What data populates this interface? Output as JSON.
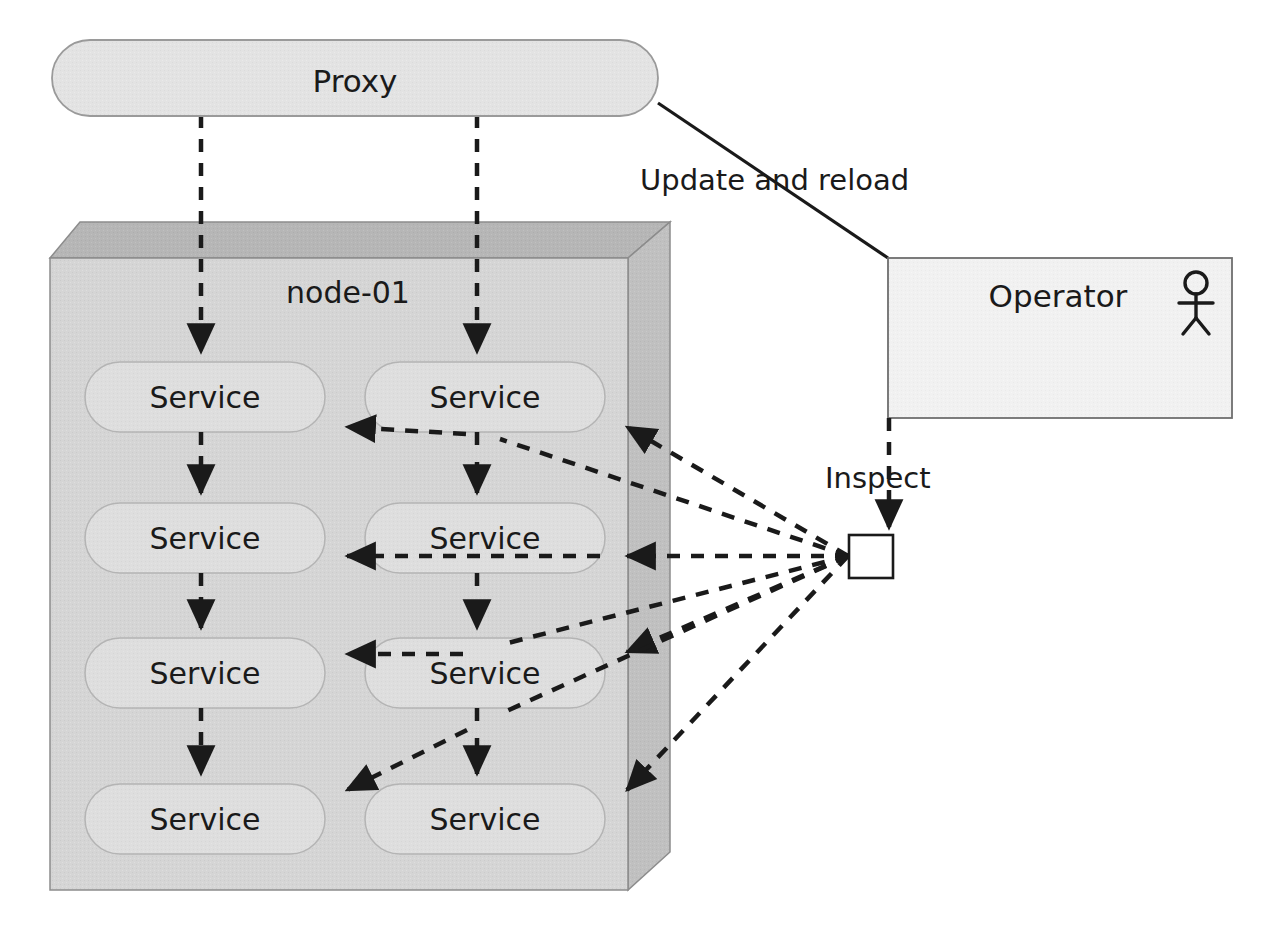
{
  "diagram": {
    "type": "uml-deployment",
    "canvas": {
      "width": 1263,
      "height": 934
    },
    "background": "#ffffff"
  },
  "proxy": {
    "label": "Proxy",
    "shape": "rounded-rectangle",
    "fill": "#e3e3e3",
    "stroke": "#9a9a9a"
  },
  "node": {
    "label": "node-01",
    "shape": "3d-node-box",
    "front_fill": "#d5d5d5",
    "top_fill": "#b6b6b6",
    "side_fill": "#c0c0c0",
    "stroke": "#8c8c8c"
  },
  "services": {
    "label": "Service",
    "shape": "rounded-rectangle",
    "fill": "#dedede",
    "stroke": "#b4b4b4",
    "items": [
      {
        "label": "Service",
        "row": 1,
        "col": "left"
      },
      {
        "label": "Service",
        "row": 1,
        "col": "right"
      },
      {
        "label": "Service",
        "row": 2,
        "col": "left"
      },
      {
        "label": "Service",
        "row": 2,
        "col": "right"
      },
      {
        "label": "Service",
        "row": 3,
        "col": "left"
      },
      {
        "label": "Service",
        "row": 3,
        "col": "right"
      },
      {
        "label": "Service",
        "row": 4,
        "col": "left"
      },
      {
        "label": "Service",
        "row": 4,
        "col": "right"
      }
    ]
  },
  "operator": {
    "label": "Operator",
    "shape": "rectangle",
    "fill": "#f1f1f1",
    "stroke": "#6e6e6e",
    "actor_icon": "stick-figure-icon"
  },
  "hub": {
    "label": "",
    "shape": "square",
    "fill": "#ffffff",
    "stroke": "#1a1a1a"
  },
  "edges": [
    {
      "name": "update-and-reload",
      "label": "Update and reload",
      "style": "solid",
      "from": "proxy",
      "to": "operator",
      "arrow": false
    },
    {
      "name": "inspect",
      "label": "Inspect",
      "style": "dashed",
      "from": "operator",
      "to": "hub",
      "arrow": true
    },
    {
      "name": "proxy-to-left-column",
      "label": "",
      "style": "dashed",
      "from": "proxy",
      "to": "service-left-column",
      "arrow": true
    },
    {
      "name": "proxy-to-right-column",
      "label": "",
      "style": "dashed",
      "from": "proxy",
      "to": "service-right-column",
      "arrow": true
    },
    {
      "name": "hub-to-services",
      "label": "",
      "style": "dashed",
      "from": "hub",
      "to": "all-services",
      "arrow": true,
      "count": 8
    }
  ],
  "colors": {
    "line": "#1a1a1a",
    "proxy_fill": "#e3e3e3",
    "node_front": "#d5d5d5",
    "node_top": "#b6b6b6",
    "node_side": "#c0c0c0",
    "service_fill": "#dedede",
    "operator_fill": "#f1f1f1"
  }
}
